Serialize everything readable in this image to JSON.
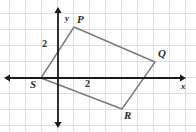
{
  "figure": {
    "type": "coordinate-plane-quadrilateral",
    "background_color": "#ffffff",
    "grid_color": "#d9dde3",
    "axis_color": "#1a1a1a",
    "shape_color": "#7a7a7a",
    "label_color": "#2b2b2b",
    "grid": {
      "cell_size_px": 16,
      "origin_px": {
        "x": 58,
        "y": 78
      },
      "x_start_px": 9,
      "y_start_px": 13,
      "show": true
    },
    "axes": {
      "x": {
        "label": "x",
        "label_pos_px": {
          "x": 181,
          "y": 82
        },
        "start_px": 9,
        "end_px": 181,
        "y_px": 78,
        "arrows": "both"
      },
      "y": {
        "label": "y",
        "label_pos_px": {
          "x": 65,
          "y": 14
        },
        "start_px": 12,
        "end_px": 123,
        "x_px": 58,
        "arrows": "both"
      }
    },
    "ticks": [
      {
        "name": "y-tick-2",
        "text": "2",
        "pos_px": {
          "x": 42,
          "y": 39
        }
      },
      {
        "name": "x-tick-2",
        "text": "2",
        "pos_px": {
          "x": 85,
          "y": 79
        }
      }
    ],
    "vertices": [
      {
        "name": "P",
        "label": "P",
        "point_px": {
          "x": 74,
          "y": 27
        },
        "label_px": {
          "x": 77,
          "y": 14
        }
      },
      {
        "name": "Q",
        "label": "Q",
        "point_px": {
          "x": 155,
          "y": 62
        },
        "label_px": {
          "x": 158,
          "y": 48
        }
      },
      {
        "name": "R",
        "label": "R",
        "point_px": {
          "x": 122,
          "y": 109
        },
        "label_px": {
          "x": 124,
          "y": 110
        }
      },
      {
        "name": "S",
        "label": "S",
        "point_px": {
          "x": 41,
          "y": 78
        },
        "label_px": {
          "x": 30,
          "y": 79
        }
      }
    ],
    "edges": [
      {
        "from": "P",
        "to": "Q"
      },
      {
        "from": "Q",
        "to": "R"
      },
      {
        "from": "R",
        "to": "S"
      },
      {
        "from": "S",
        "to": "P"
      }
    ]
  }
}
